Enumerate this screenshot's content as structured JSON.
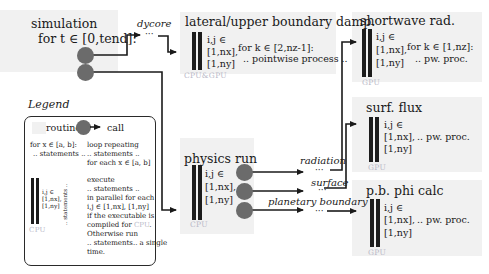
{
  "simulation": {
    "title_line1": "simulation",
    "title_line2": "for t ∈ [0,tend]:"
  },
  "dycore": {
    "label": "dycore",
    "ellipsis": "···"
  },
  "lateral_box": {
    "title": "lateral/upper boundary damp.",
    "ij_line1": "i,j ∈",
    "ij_line2": "[1,nx],",
    "ij_line3": "[1,ny]",
    "loop_line1": "for k ∈ [2,nz-1]:",
    "loop_line2": ".. pointwise process ..",
    "device": "CPU&GPU"
  },
  "physics_box": {
    "title": "physics run",
    "ij_line1": "i,j ∈",
    "ij_line2": "[1,nx],",
    "ij_line3": "[1,ny]",
    "device": "CPU"
  },
  "physics_calls": {
    "radiation": "radiation",
    "surface": "surface",
    "planetary_boundary": "planetary boundary",
    "ellipsis": "···"
  },
  "shortwave_box": {
    "title": "shortwave rad.",
    "ij_line1": "i,j ∈",
    "ij_line2": "[1,nx],",
    "ij_line3": "[1,ny]",
    "loop_line1": "for k ∈ [1,nz]:",
    "loop_line2": ".. pw. proc.",
    "device": "GPU"
  },
  "surf_flux_box": {
    "title": "surf. flux",
    "ij_line1": "i,j ∈",
    "ij_line2": "[1,nx],",
    "ij_line3": "[1,ny]",
    "process": ".. pw. proc.",
    "device": "GPU"
  },
  "pb_phi_box": {
    "title": "p.b. phi calc",
    "ij_line1": "i,j ∈",
    "ij_line2": "[1,nx],",
    "ij_line3": "[1,ny]",
    "process": ".. pw. proc.",
    "device": "GPU"
  },
  "legend": {
    "title": "Legend",
    "routine": "routine",
    "call": "call",
    "loop_code_line1": "for x ∈ [a, b]:",
    "loop_code_line2": ".. statements ..",
    "loop_desc_line1": "loop repeating",
    "loop_desc_line2": ".. statements ..",
    "loop_desc_line3": "for each x ∈ [a, b]",
    "par_ij_line1": "i,j ∈",
    "par_ij_line2": "[1,nx],",
    "par_ij_line3": "[1,ny]",
    "par_statements": ".. statements ..",
    "par_device": "CPU",
    "par_desc": [
      "execute",
      ".. statements ..",
      "in parallel for each",
      "i,j ∈  [1,nx], [1,ny]",
      "if the executable is",
      "compiled for",
      "Otherwise run",
      ".. statements.. a single",
      "time."
    ],
    "par_desc_device": "CPU",
    "par_desc_device_suffix": "."
  }
}
